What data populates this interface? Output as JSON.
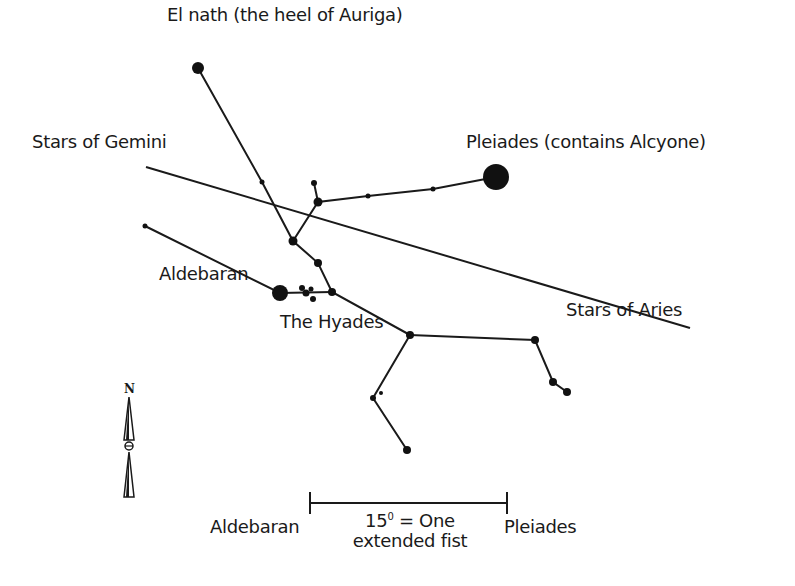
{
  "chart_data": {
    "type": "diagram",
    "labels": [
      {
        "id": "el-nath",
        "text": "El nath (the heel of Auriga)",
        "x": 167,
        "y": 4
      },
      {
        "id": "gemini",
        "text": "Stars of Gemini",
        "x": 32,
        "y": 131
      },
      {
        "id": "pleiades",
        "text": "Pleiades (contains Alcyone)",
        "x": 466,
        "y": 131
      },
      {
        "id": "aldebaran",
        "text": "Aldebaran",
        "x": 159,
        "y": 263
      },
      {
        "id": "hyades",
        "text": "The Hyades",
        "x": 280,
        "y": 311
      },
      {
        "id": "aries",
        "text": "Stars of Aries",
        "x": 566,
        "y": 299
      }
    ],
    "stars": [
      {
        "name": "El Nath",
        "x": 198,
        "y": 68,
        "r": 6
      },
      {
        "name": "Pleiades",
        "x": 496,
        "y": 177,
        "r": 13
      },
      {
        "name": "Aldebaran",
        "x": 280,
        "y": 293,
        "r": 8
      },
      {
        "name": "",
        "x": 262,
        "y": 182,
        "r": 2.5
      },
      {
        "name": "",
        "x": 314,
        "y": 183,
        "r": 3
      },
      {
        "name": "",
        "x": 318,
        "y": 202,
        "r": 4.5
      },
      {
        "name": "",
        "x": 368,
        "y": 196,
        "r": 2.5
      },
      {
        "name": "",
        "x": 433,
        "y": 189,
        "r": 2.5
      },
      {
        "name": "",
        "x": 293,
        "y": 241,
        "r": 4.5
      },
      {
        "name": "",
        "x": 318,
        "y": 263,
        "r": 4
      },
      {
        "name": "",
        "x": 332,
        "y": 292,
        "r": 4
      },
      {
        "name": "",
        "x": 302,
        "y": 288,
        "r": 3
      },
      {
        "name": "",
        "x": 306,
        "y": 293,
        "r": 3.5
      },
      {
        "name": "",
        "x": 311,
        "y": 289,
        "r": 2.5
      },
      {
        "name": "",
        "x": 313,
        "y": 299,
        "r": 3
      },
      {
        "name": "",
        "x": 145,
        "y": 226,
        "r": 2.5
      },
      {
        "name": "",
        "x": 410,
        "y": 335,
        "r": 4
      },
      {
        "name": "",
        "x": 535,
        "y": 340,
        "r": 4
      },
      {
        "name": "",
        "x": 553,
        "y": 382,
        "r": 4
      },
      {
        "name": "",
        "x": 567,
        "y": 392,
        "r": 4
      },
      {
        "name": "",
        "x": 373,
        "y": 398,
        "r": 3
      },
      {
        "name": "",
        "x": 381,
        "y": 393,
        "r": 2
      },
      {
        "name": "",
        "x": 407,
        "y": 450,
        "r": 4
      }
    ],
    "lines": [
      {
        "name": "el-nath-line",
        "points": [
          [
            198,
            68
          ],
          [
            262,
            182
          ],
          [
            293,
            241
          ],
          [
            318,
            263
          ],
          [
            332,
            292
          ],
          [
            410,
            335
          ]
        ]
      },
      {
        "name": "gemini-aries-line",
        "points": [
          [
            146,
            167
          ],
          [
            690,
            328
          ]
        ]
      },
      {
        "name": "pleiades-line",
        "points": [
          [
            496,
            177
          ],
          [
            433,
            189
          ],
          [
            368,
            196
          ],
          [
            318,
            202
          ],
          [
            293,
            241
          ]
        ]
      },
      {
        "name": "short-spur",
        "points": [
          [
            318,
            202
          ],
          [
            314,
            183
          ]
        ]
      },
      {
        "name": "aldebaran-line",
        "points": [
          [
            145,
            226
          ],
          [
            280,
            293
          ],
          [
            332,
            292
          ]
        ]
      },
      {
        "name": "right-branch",
        "points": [
          [
            410,
            335
          ],
          [
            535,
            340
          ],
          [
            553,
            382
          ],
          [
            567,
            392
          ]
        ]
      },
      {
        "name": "lower-branch",
        "points": [
          [
            410,
            335
          ],
          [
            373,
            398
          ],
          [
            407,
            450
          ]
        ]
      }
    ],
    "scale_bar": {
      "x1": 310,
      "x2": 507,
      "y": 503,
      "left_label": "Aldebaran",
      "right_label": "Pleiades",
      "measure_value": "15",
      "measure_unit": "0",
      "measure_text": "= One",
      "measure_text_2": "extended fist"
    },
    "compass": {
      "label": "N",
      "x": 129,
      "y": 390
    }
  }
}
